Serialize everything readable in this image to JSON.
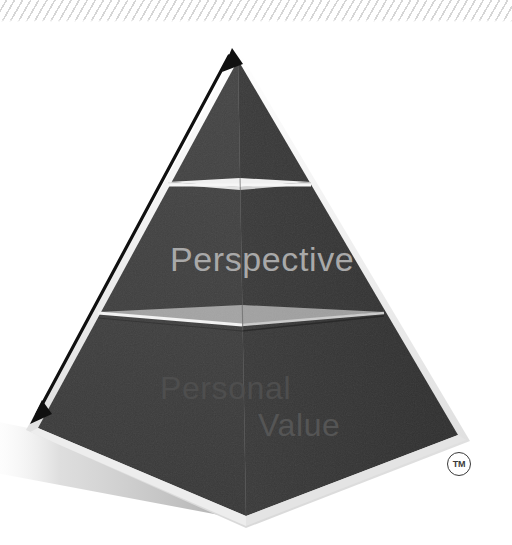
{
  "page": {
    "background_color": "#ffffff",
    "width": 512,
    "height": 545
  },
  "decoration": {
    "hatch_strip": {
      "name": "diagonal-hatch-strip",
      "line_color": "#cfcfcf",
      "background_color": "#ffffff"
    }
  },
  "pyramid": {
    "name": "three-tier-pyramid",
    "apex": {
      "x": 238,
      "y": 57
    },
    "base_left": {
      "x": 38,
      "y": 430
    },
    "base_right": {
      "x": 462,
      "y": 437
    },
    "base_front": {
      "x": 246,
      "y": 520
    },
    "front_face_color": "#3f3f3f",
    "right_face_color": "#343434",
    "edge_highlight_color": "#f2f2f2",
    "shadow_color": "#b8b8b8",
    "tiers": [
      {
        "index": 0,
        "label": "",
        "divider_y": 186
      },
      {
        "index": 1,
        "label": "Perspective",
        "divider_y": 316
      },
      {
        "index": 2,
        "label": "Personal Value",
        "divider_y": 520
      }
    ]
  },
  "labels": {
    "perspective": "Perspective",
    "personal": "Personal",
    "value": "Value"
  },
  "arrow": {
    "name": "double-headed-growth-arrow",
    "color": "#111111",
    "start": {
      "x": 33,
      "y": 422
    },
    "end": {
      "x": 232,
      "y": 48
    },
    "heads": "both"
  },
  "trademark": {
    "symbol": "TM",
    "name": "trademark-mark"
  }
}
